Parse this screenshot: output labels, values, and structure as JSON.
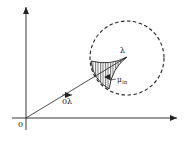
{
  "diagram": {
    "type": "vector-geometry",
    "origin_label": "0",
    "point_label": "λ",
    "vector_label": "0λ",
    "region_label_main": "μ",
    "region_label_sub": "in",
    "elements": [
      {
        "kind": "axis",
        "name": "x-axis",
        "from": [
          12,
          118
        ],
        "to": [
          178,
          118
        ]
      },
      {
        "kind": "axis",
        "name": "y-axis",
        "from": [
          26,
          130
        ],
        "to": [
          26,
          6
        ]
      },
      {
        "kind": "vector",
        "name": "0λ",
        "from": [
          26,
          118
        ],
        "to": [
          127,
          57
        ]
      },
      {
        "kind": "dashed-circle",
        "center": [
          127,
          58
        ],
        "radius": 37
      },
      {
        "kind": "hatched-region",
        "name": "μin"
      }
    ],
    "colors": {
      "ink": "#222222",
      "background": "#ffffff"
    }
  }
}
